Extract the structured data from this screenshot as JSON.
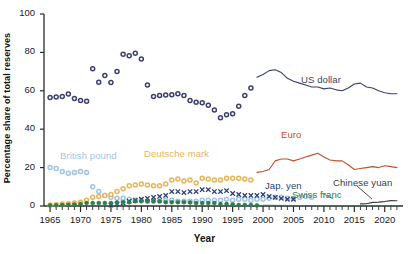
{
  "chart_data": {
    "type": "scatter",
    "title": "",
    "xlabel": "Year",
    "ylabel": "Percentage share of total reserves",
    "xlim": [
      1964,
      2023
    ],
    "ylim": [
      0,
      100
    ],
    "ytick_values": [
      0,
      20,
      40,
      60,
      80,
      100
    ],
    "ytick_labels": [
      "0",
      "20",
      "40",
      "60",
      "80",
      "100"
    ],
    "xtick_values": [
      1965,
      1970,
      1975,
      1980,
      1985,
      1990,
      1995,
      2000,
      2005,
      2010,
      2015,
      2020
    ],
    "xtick_labels": [
      "1965",
      "1970",
      "1975",
      "1980",
      "1985",
      "1990",
      "1995",
      "2000",
      "2005",
      "2010",
      "2015",
      "2020"
    ],
    "minor_xtick_interval": 1,
    "grid": false,
    "legend_position": "inline-annotations",
    "series": [
      {
        "name": "US dollar",
        "color": "#3a3f6e",
        "marker": "open-circle",
        "render": "markers-then-line",
        "line_from_year": 1999,
        "x": [
          1965,
          1966,
          1967,
          1968,
          1969,
          1970,
          1971,
          1972,
          1973,
          1974,
          1975,
          1976,
          1977,
          1978,
          1979,
          1980,
          1981,
          1982,
          1983,
          1984,
          1985,
          1986,
          1987,
          1988,
          1989,
          1990,
          1991,
          1992,
          1993,
          1994,
          1995,
          1996,
          1997,
          1998,
          1999,
          2000,
          2001,
          2002,
          2003,
          2004,
          2005,
          2006,
          2007,
          2008,
          2009,
          2010,
          2011,
          2012,
          2013,
          2014,
          2015,
          2016,
          2017,
          2018,
          2019,
          2020,
          2021,
          2022
        ],
        "values": [
          56.5,
          56.8,
          57.0,
          58.3,
          56.0,
          55.0,
          54.5,
          71.5,
          64.5,
          68.0,
          64.3,
          70.0,
          79.0,
          78.2,
          79.5,
          76.5,
          63.0,
          57.0,
          57.5,
          57.8,
          58.0,
          58.5,
          57.5,
          55.0,
          54.0,
          53.8,
          52.5,
          50.0,
          46.0,
          47.5,
          48.0,
          52.0,
          57.5,
          61.5,
          67.0,
          68.5,
          70.5,
          71.0,
          69.5,
          66.5,
          65.0,
          64.0,
          63.0,
          62.0,
          62.0,
          61.0,
          61.5,
          60.5,
          60.0,
          61.5,
          63.5,
          64.0,
          62.0,
          61.5,
          60.0,
          59.0,
          58.5,
          58.5
        ]
      },
      {
        "name": "Euro",
        "color": "#c0502a",
        "marker": "none",
        "render": "line",
        "x": [
          1999,
          2000,
          2001,
          2002,
          2003,
          2004,
          2005,
          2006,
          2007,
          2008,
          2009,
          2010,
          2011,
          2012,
          2013,
          2014,
          2015,
          2016,
          2017,
          2018,
          2019,
          2020,
          2021,
          2022
        ],
        "values": [
          17.5,
          18.0,
          19.0,
          23.5,
          24.5,
          24.5,
          23.5,
          24.5,
          25.5,
          26.5,
          27.5,
          25.5,
          24.0,
          23.5,
          23.5,
          21.5,
          19.0,
          19.5,
          20.0,
          20.5,
          20.0,
          21.0,
          20.5,
          20.0
        ]
      },
      {
        "name": "British pound",
        "color": "#9fc4e3",
        "marker": "open-circle",
        "render": "markers",
        "x": [
          1965,
          1966,
          1967,
          1968,
          1969,
          1970,
          1971,
          1972,
          1973,
          1974,
          1975,
          1976,
          1977,
          1978,
          1979,
          1980,
          1981,
          1982,
          1983,
          1984,
          1985,
          1986,
          1987,
          1988,
          1989,
          1990,
          1991,
          1992,
          1993,
          1994,
          1995,
          1996,
          1997,
          1998,
          1999,
          2000,
          2001,
          2002,
          2003,
          2004,
          2005,
          2006,
          2007,
          2008
        ],
        "values": [
          20.0,
          19.5,
          18.0,
          17.0,
          17.5,
          18.0,
          17.5,
          10.0,
          7.5,
          5.5,
          4.5,
          4.0,
          4.0,
          3.5,
          3.0,
          3.0,
          2.5,
          2.5,
          2.5,
          3.0,
          3.0,
          2.5,
          2.5,
          2.5,
          2.5,
          3.0,
          3.0,
          3.0,
          3.0,
          3.5,
          3.0,
          3.5,
          3.5,
          3.0,
          3.5,
          3.5,
          4.0,
          4.5,
          4.5,
          4.0,
          4.0,
          4.5,
          5.0,
          4.5
        ]
      },
      {
        "name": "Deutsche mark",
        "color": "#e8b45a",
        "marker": "open-circle",
        "render": "markers",
        "x": [
          1965,
          1966,
          1967,
          1968,
          1969,
          1970,
          1971,
          1972,
          1973,
          1974,
          1975,
          1976,
          1977,
          1978,
          1979,
          1980,
          1981,
          1982,
          1983,
          1984,
          1985,
          1986,
          1987,
          1988,
          1989,
          1990,
          1991,
          1992,
          1993,
          1994,
          1995,
          1996,
          1997,
          1998
        ],
        "values": [
          0.5,
          0.7,
          1.0,
          1.2,
          1.5,
          2.0,
          3.0,
          4.5,
          5.0,
          5.5,
          6.0,
          7.5,
          9.0,
          10.5,
          11.0,
          11.5,
          11.0,
          10.5,
          10.5,
          11.5,
          13.5,
          14.0,
          13.0,
          13.5,
          12.0,
          14.5,
          14.0,
          13.5,
          13.5,
          14.5,
          14.5,
          14.5,
          14.0,
          13.5
        ]
      },
      {
        "name": "Jap. yen",
        "color": "#2c3f7a",
        "marker": "cross",
        "render": "markers",
        "x": [
          1975,
          1976,
          1977,
          1978,
          1979,
          1980,
          1981,
          1982,
          1983,
          1984,
          1985,
          1986,
          1987,
          1988,
          1989,
          1990,
          1991,
          1992,
          1993,
          1994,
          1995,
          1996,
          1997,
          1998,
          1999,
          2000,
          2001,
          2002,
          2003,
          2004,
          2005
        ],
        "values": [
          0.5,
          1.0,
          1.5,
          2.5,
          3.0,
          3.5,
          4.0,
          4.5,
          5.0,
          5.5,
          7.5,
          7.5,
          7.0,
          7.5,
          7.5,
          8.5,
          8.5,
          7.5,
          7.5,
          8.0,
          6.5,
          6.0,
          5.5,
          5.5,
          5.5,
          6.0,
          5.0,
          4.5,
          4.0,
          3.5,
          3.5
        ]
      },
      {
        "name": "Swiss franc",
        "color": "#2e7d4f",
        "marker": "filled-circle",
        "render": "markers-then-line",
        "line_from_year": 2000,
        "x": [
          1965,
          1966,
          1967,
          1968,
          1969,
          1970,
          1971,
          1972,
          1973,
          1974,
          1975,
          1976,
          1977,
          1978,
          1979,
          1980,
          1981,
          1982,
          1983,
          1984,
          1985,
          1986,
          1987,
          1988,
          1989,
          1990,
          1991,
          1992,
          1993,
          1994,
          1995,
          1996,
          1997,
          1998,
          1999,
          2000,
          2005,
          2010,
          2015,
          2020,
          2022
        ],
        "values": [
          0.3,
          0.4,
          0.5,
          0.6,
          0.8,
          1.0,
          1.5,
          1.5,
          1.5,
          1.5,
          1.5,
          1.8,
          2.0,
          2.0,
          2.5,
          2.5,
          2.5,
          2.5,
          2.5,
          2.0,
          2.0,
          2.0,
          2.0,
          1.8,
          1.5,
          1.5,
          1.5,
          1.5,
          1.0,
          1.0,
          0.8,
          0.5,
          0.5,
          0.5,
          0.3,
          0.3,
          0.2,
          0.2,
          0.2,
          0.2,
          0.2
        ]
      },
      {
        "name": "Chinese yuan",
        "color": "#3b3b3b",
        "marker": "none",
        "render": "line",
        "x": [
          2016,
          2017,
          2018,
          2019,
          2020,
          2021,
          2022
        ],
        "values": [
          1.1,
          1.2,
          1.9,
          2.0,
          2.3,
          2.8,
          2.7
        ]
      }
    ],
    "annotations": [
      {
        "name": "us-dollar",
        "text": "US dollar",
        "color": "#3a3f6e",
        "x_px": 301,
        "y_px": 74
      },
      {
        "name": "euro",
        "text": "Euro",
        "color": "#c0502a",
        "x_px": 281,
        "y_px": 129
      },
      {
        "name": "british-pound",
        "text": "British pound",
        "color": "#9fc4e3",
        "x_px": 60,
        "y_px": 150
      },
      {
        "name": "deutsche-mark",
        "text": "Deutsche mark",
        "color": "#e8b45a",
        "x_px": 144,
        "y_px": 148
      },
      {
        "name": "jap-yen",
        "text": "Jap. yen",
        "color": "#2c3f7a",
        "x_px": 265,
        "y_px": 180
      },
      {
        "name": "swiss-franc",
        "text": "Swiss franc",
        "color": "#2e7d4f",
        "x_px": 292,
        "y_px": 189
      },
      {
        "name": "chinese-yuan",
        "text": "Chinese yuan",
        "color": "#3b3b3b",
        "x_px": 333,
        "y_px": 177
      }
    ]
  },
  "axes": {
    "y_title": "Percentage share of total reserves",
    "x_title": "Year"
  }
}
